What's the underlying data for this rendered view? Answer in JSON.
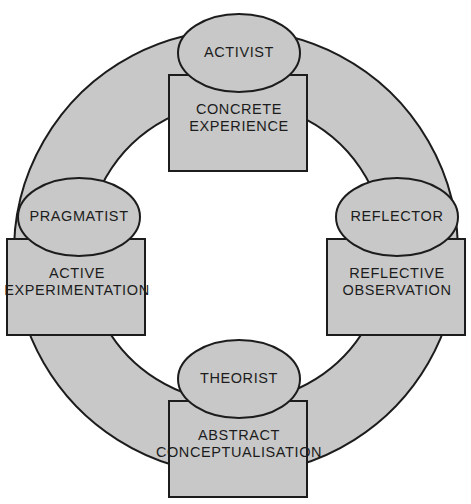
{
  "diagram": {
    "type": "cycle",
    "colors": {
      "fill": "#c8c8c8",
      "stroke": "#1c1c1c",
      "text": "#1c1c1c",
      "background": "#ffffff"
    },
    "ring": {
      "center_x": 236,
      "center_y": 252,
      "outer_radius": 222,
      "inner_radius": 150
    },
    "nodes": [
      {
        "id": "top",
        "position": "top",
        "style_label": "ACTIVIST",
        "stage_label": "CONCRETE\nEXPERIENCE",
        "ellipse": {
          "cx": 239,
          "cy": 53,
          "rx": 61,
          "ry": 39
        },
        "rect": {
          "x": 169,
          "y": 75,
          "w": 138,
          "h": 96
        },
        "style_text_xy": {
          "x": 239,
          "y": 53
        },
        "stage_text_xy": {
          "x": 239,
          "y": 118
        }
      },
      {
        "id": "right",
        "position": "right",
        "style_label": "REFLECTOR",
        "stage_label": "REFLECTIVE\nOBSERVATION",
        "ellipse": {
          "cx": 397,
          "cy": 217,
          "rx": 61,
          "ry": 39
        },
        "rect": {
          "x": 327,
          "y": 239,
          "w": 138,
          "h": 96
        },
        "style_text_xy": {
          "x": 397,
          "y": 217
        },
        "stage_text_xy": {
          "x": 397,
          "y": 282
        }
      },
      {
        "id": "bottom",
        "position": "bottom",
        "style_label": "THEORIST",
        "stage_label": "ABSTRACT\nCONCEPTUALISATION",
        "ellipse": {
          "cx": 239,
          "cy": 379,
          "rx": 61,
          "ry": 39
        },
        "rect": {
          "x": 169,
          "y": 401,
          "w": 138,
          "h": 96
        },
        "style_text_xy": {
          "x": 239,
          "y": 379
        },
        "stage_text_xy": {
          "x": 239,
          "y": 444
        }
      },
      {
        "id": "left",
        "position": "left",
        "style_label": "PRAGMATIST",
        "stage_label": "ACTIVE\nEXPERIMENTATION",
        "ellipse": {
          "cx": 79,
          "cy": 217,
          "rx": 61,
          "ry": 39
        },
        "rect": {
          "x": 7,
          "y": 239,
          "w": 138,
          "h": 96
        },
        "style_text_xy": {
          "x": 79,
          "y": 217
        },
        "stage_text_xy": {
          "x": 77,
          "y": 282
        }
      }
    ]
  }
}
